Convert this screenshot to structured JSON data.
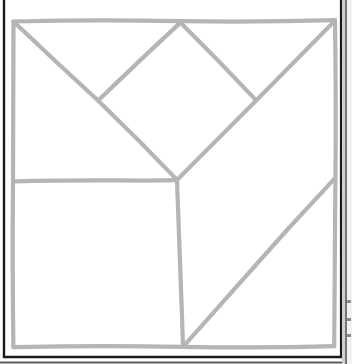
{
  "page": {
    "width": 352,
    "height": 364,
    "background_color": "#ffffff"
  },
  "style": {
    "stroke_color": "#b5b5b5",
    "stroke_color_dark": "#1a1a1a",
    "stroke_color_edge": "#7a7a7a",
    "stroke_width_figure": 4.2,
    "stroke_width_border": 2.2,
    "line_cap": "round",
    "line_join": "round"
  },
  "figure": {
    "name": "tangram-square",
    "square": {
      "label": "outer-square",
      "top_left": [
        13,
        21
      ],
      "top_right": [
        335,
        20
      ],
      "bottom_right": [
        334,
        346
      ],
      "bottom_left": [
        13,
        347
      ]
    },
    "vertices": {
      "top_left_corner": [
        13,
        21
      ],
      "top_right_corner": [
        335,
        20
      ],
      "bottom_right_corner": [
        334,
        346
      ],
      "bottom_left_corner": [
        13,
        347
      ],
      "top_apex": [
        180,
        22
      ],
      "left_cross": [
        98,
        100
      ],
      "right_junction": [
        256,
        100
      ],
      "center_junction": [
        177,
        180
      ],
      "left_mid_edge": [
        13,
        181
      ],
      "bottom_mid": [
        183,
        347
      ],
      "right_mid_edge": [
        335,
        178
      ]
    },
    "segments": [
      {
        "name": "square-top-edge",
        "from": [
          13,
          21
        ],
        "to": [
          335,
          20
        ]
      },
      {
        "name": "square-right-edge",
        "from": [
          335,
          20
        ],
        "to": [
          334,
          346
        ]
      },
      {
        "name": "square-bottom-edge",
        "from": [
          334,
          346
        ],
        "to": [
          13,
          347
        ]
      },
      {
        "name": "square-left-edge",
        "from": [
          13,
          347
        ],
        "to": [
          13,
          21
        ]
      },
      {
        "name": "main-diagonal-upper-left",
        "from": [
          13,
          21
        ],
        "to": [
          177,
          180
        ]
      },
      {
        "name": "diamond-left-edge",
        "from": [
          180,
          22
        ],
        "to": [
          98,
          100
        ]
      },
      {
        "name": "diamond-right-edge",
        "from": [
          180,
          22
        ],
        "to": [
          256,
          100
        ]
      },
      {
        "name": "long-diagonal-top-right",
        "from": [
          335,
          20
        ],
        "to": [
          177,
          180
        ]
      },
      {
        "name": "horizontal-mid-left",
        "from": [
          13,
          181
        ],
        "to": [
          177,
          180
        ]
      },
      {
        "name": "vertical-lower-center",
        "from": [
          177,
          180
        ],
        "to": [
          183,
          347
        ]
      },
      {
        "name": "lower-right-diagonal",
        "from": [
          183,
          347
        ],
        "to": [
          335,
          178
        ]
      }
    ]
  },
  "page_border": {
    "name": "scan-page-border",
    "left_rule": {
      "from": [
        4,
        0
      ],
      "to": [
        4,
        357
      ]
    },
    "bottom_rule": {
      "from": [
        3,
        357
      ],
      "to": [
        341,
        357
      ]
    },
    "right_rule_outer": {
      "from": [
        345,
        0
      ],
      "to": [
        345,
        364
      ]
    },
    "right_rule_inner": {
      "from": [
        341,
        0
      ],
      "to": [
        341,
        357
      ]
    },
    "bottom_rule_outer": {
      "from": [
        0,
        362
      ],
      "to": [
        352,
        362
      ]
    }
  },
  "marks": [
    {
      "name": "edge-tick-1",
      "x": 347,
      "y": 300,
      "w": 4,
      "h": 3
    },
    {
      "name": "edge-tick-2",
      "x": 347,
      "y": 318,
      "w": 4,
      "h": 3
    },
    {
      "name": "edge-tick-3",
      "x": 347,
      "y": 334,
      "w": 4,
      "h": 3
    }
  ]
}
